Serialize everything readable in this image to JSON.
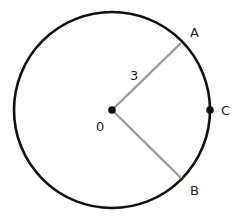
{
  "diagram": {
    "type": "circle-geometry",
    "center": {
      "label": "0",
      "x": 112,
      "y": 110
    },
    "radius_px": 98,
    "radius_label": "3",
    "points": [
      {
        "label": "A",
        "x": 181,
        "y": 43
      },
      {
        "label": "B",
        "x": 181,
        "y": 178
      },
      {
        "label": "C",
        "x": 210,
        "y": 110
      }
    ],
    "colors": {
      "circle": "#111111",
      "radii": "#9a9a9a",
      "text": "#222222"
    }
  }
}
